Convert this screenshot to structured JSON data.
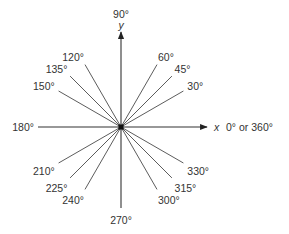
{
  "diagram": {
    "center": {
      "x": 121,
      "y": 127
    },
    "colors": {
      "line": "#4a4a4a",
      "text": "#333333",
      "axis": "#222222"
    },
    "axes": {
      "x_label": "x",
      "y_label": "y",
      "x_end_label": "0° or 360°",
      "top_label": "90°",
      "left_label": "180°",
      "bottom_label": "270°"
    },
    "rays": [
      {
        "angle": 30,
        "label": "30°"
      },
      {
        "angle": 45,
        "label": "45°"
      },
      {
        "angle": 60,
        "label": "60°"
      },
      {
        "angle": 120,
        "label": "120°"
      },
      {
        "angle": 135,
        "label": "135°"
      },
      {
        "angle": 150,
        "label": "150°"
      },
      {
        "angle": 210,
        "label": "210°"
      },
      {
        "angle": 225,
        "label": "225°"
      },
      {
        "angle": 240,
        "label": "240°"
      },
      {
        "angle": 300,
        "label": "300°"
      },
      {
        "angle": 315,
        "label": "315°"
      },
      {
        "angle": 330,
        "label": "330°"
      }
    ]
  }
}
